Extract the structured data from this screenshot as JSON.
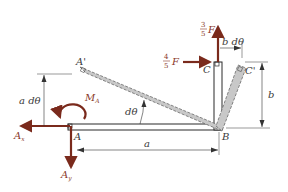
{
  "colors": {
    "force": "#7a2a1c",
    "member_fill": "#c8c8c8",
    "member_edge": "#6a6a6a",
    "line": "#2a2a2a",
    "dim": "#555555",
    "text": "#3a3a3a"
  },
  "points": {
    "A": "A",
    "A_prime": "A'",
    "B": "B",
    "C": "C",
    "C_prime": "C'"
  },
  "forces": {
    "vertical_F": {
      "num": "3",
      "den": "5",
      "var": "F"
    },
    "horizontal_F": {
      "num": "4",
      "den": "5",
      "var": "F"
    },
    "Ax": {
      "main": "A",
      "sub": "x"
    },
    "Ay": {
      "main": "A",
      "sub": "y"
    },
    "MA": {
      "main": "M",
      "sub": "A"
    }
  },
  "dimensions": {
    "a": "a",
    "a_dtheta": "a dθ",
    "b": "b",
    "b_dtheta": "b dθ",
    "dtheta": "dθ"
  }
}
